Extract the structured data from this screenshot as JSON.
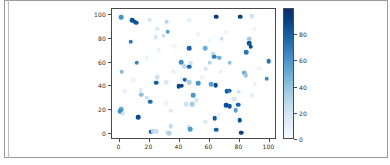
{
  "figure": {
    "background_color": "#ffffff",
    "frame_color": "#9a9a9a"
  },
  "chart_data": {
    "type": "scatter",
    "title": "",
    "xlabel": "",
    "ylabel": "",
    "colormap": "Blues",
    "grid": false,
    "legend": null,
    "xlim": [
      -5,
      105
    ],
    "ylim": [
      -5,
      105
    ],
    "xticks": [
      0,
      20,
      40,
      60,
      80,
      100
    ],
    "yticks": [
      0,
      20,
      40,
      60,
      80,
      100
    ],
    "xticklabels": [
      "0",
      "20",
      "40",
      "60",
      "80",
      "100"
    ],
    "yticklabels": [
      "0",
      "20",
      "40",
      "60",
      "80",
      "100"
    ],
    "colorbar": {
      "ticks": [
        0,
        20,
        40,
        60,
        80
      ],
      "ticklabels": [
        "0",
        "20",
        "40",
        "60",
        "80"
      ],
      "vmin": 0,
      "vmax": 100,
      "low_color": "#f7fbff",
      "high_color": "#08306b",
      "position": "right",
      "orientation": "vertical"
    },
    "marker": "o",
    "n_points": 100,
    "points": [
      {
        "x": 1.0,
        "y": 98.0,
        "c": 62
      },
      {
        "x": 8.5,
        "y": 95.5,
        "c": 88
      },
      {
        "x": 10.0,
        "y": 94.5,
        "c": 90
      },
      {
        "x": 11.0,
        "y": 93.5,
        "c": 85
      },
      {
        "x": 20.0,
        "y": 96.0,
        "c": 18
      },
      {
        "x": 31.5,
        "y": 94.5,
        "c": 30
      },
      {
        "x": 46.5,
        "y": 95.5,
        "c": 8
      },
      {
        "x": 64.5,
        "y": 98.5,
        "c": 96
      },
      {
        "x": 80.5,
        "y": 98.5,
        "c": 94
      },
      {
        "x": 88.0,
        "y": 99.0,
        "c": 20
      },
      {
        "x": 25.0,
        "y": 88.5,
        "c": 14
      },
      {
        "x": 32.0,
        "y": 86.0,
        "c": 58
      },
      {
        "x": 29.5,
        "y": 82.5,
        "c": 22
      },
      {
        "x": 24.0,
        "y": 81.5,
        "c": 16
      },
      {
        "x": 68.0,
        "y": 80.0,
        "c": 20
      },
      {
        "x": 86.5,
        "y": 80.0,
        "c": 36
      },
      {
        "x": 7.5,
        "y": 77.5,
        "c": 72
      },
      {
        "x": 86.5,
        "y": 76.5,
        "c": 85
      },
      {
        "x": 87.5,
        "y": 73.5,
        "c": 90
      },
      {
        "x": 46.5,
        "y": 72.0,
        "c": 80
      },
      {
        "x": 57.0,
        "y": 72.0,
        "c": 50
      },
      {
        "x": 62.5,
        "y": 67.5,
        "c": 26
      },
      {
        "x": 63.0,
        "y": 65.0,
        "c": 70
      },
      {
        "x": 84.5,
        "y": 68.5,
        "c": 72
      },
      {
        "x": 66.5,
        "y": 64.0,
        "c": 48
      },
      {
        "x": 11.5,
        "y": 60.0,
        "c": 68
      },
      {
        "x": 99.5,
        "y": 61.0,
        "c": 74
      },
      {
        "x": 41.0,
        "y": 60.5,
        "c": 64
      },
      {
        "x": 47.5,
        "y": 59.5,
        "c": 20
      },
      {
        "x": 60.0,
        "y": 60.0,
        "c": 30
      },
      {
        "x": 73.5,
        "y": 60.0,
        "c": 40
      },
      {
        "x": 43.0,
        "y": 57.0,
        "c": 26
      },
      {
        "x": 46.5,
        "y": 56.5,
        "c": 78
      },
      {
        "x": 57.5,
        "y": 55.0,
        "c": 18
      },
      {
        "x": 1.5,
        "y": 52.5,
        "c": 44
      },
      {
        "x": 83.0,
        "y": 51.5,
        "c": 50
      },
      {
        "x": 84.0,
        "y": 49.5,
        "c": 40
      },
      {
        "x": 25.0,
        "y": 47.5,
        "c": 20
      },
      {
        "x": 41.5,
        "y": 46.5,
        "c": 10
      },
      {
        "x": 43.5,
        "y": 45.5,
        "c": 80
      },
      {
        "x": 46.5,
        "y": 43.5,
        "c": 34
      },
      {
        "x": 98.0,
        "y": 46.5,
        "c": 66
      },
      {
        "x": 31.0,
        "y": 43.5,
        "c": 14
      },
      {
        "x": 24.5,
        "y": 43.0,
        "c": 82
      },
      {
        "x": 41.5,
        "y": 40.5,
        "c": 96
      },
      {
        "x": 39.5,
        "y": 40.0,
        "c": 92
      },
      {
        "x": 52.5,
        "y": 42.5,
        "c": 62
      },
      {
        "x": 61.0,
        "y": 42.0,
        "c": 56
      },
      {
        "x": 64.0,
        "y": 41.0,
        "c": 90
      },
      {
        "x": 14.0,
        "y": 37.0,
        "c": 12
      },
      {
        "x": 3.5,
        "y": 36.0,
        "c": 8
      },
      {
        "x": 71.5,
        "y": 36.0,
        "c": 82
      },
      {
        "x": 73.0,
        "y": 36.5,
        "c": 76
      },
      {
        "x": 79.5,
        "y": 35.5,
        "c": 20
      },
      {
        "x": 14.5,
        "y": 33.0,
        "c": 42
      },
      {
        "x": 49.0,
        "y": 32.5,
        "c": 60
      },
      {
        "x": 88.0,
        "y": 32.5,
        "c": 10
      },
      {
        "x": 18.0,
        "y": 30.5,
        "c": 22
      },
      {
        "x": 20.5,
        "y": 27.0,
        "c": 76
      },
      {
        "x": 51.0,
        "y": 28.5,
        "c": 14
      },
      {
        "x": 76.5,
        "y": 29.5,
        "c": 16
      },
      {
        "x": 31.0,
        "y": 26.0,
        "c": 6
      },
      {
        "x": 44.5,
        "y": 25.0,
        "c": 20
      },
      {
        "x": 48.5,
        "y": 25.0,
        "c": 36
      },
      {
        "x": 71.0,
        "y": 24.0,
        "c": 88
      },
      {
        "x": 73.5,
        "y": 23.5,
        "c": 86
      },
      {
        "x": 79.0,
        "y": 24.5,
        "c": 80
      },
      {
        "x": 1.0,
        "y": 21.0,
        "c": 52
      },
      {
        "x": 0.5,
        "y": 19.0,
        "c": 64
      },
      {
        "x": 2.0,
        "y": 17.0,
        "c": 24
      },
      {
        "x": 34.0,
        "y": 19.5,
        "c": 16
      },
      {
        "x": 77.5,
        "y": 20.0,
        "c": 56
      },
      {
        "x": 12.5,
        "y": 14.0,
        "c": 90
      },
      {
        "x": 63.5,
        "y": 13.5,
        "c": 84
      },
      {
        "x": 80.0,
        "y": 11.5,
        "c": 88
      },
      {
        "x": 57.0,
        "y": 10.5,
        "c": 12
      },
      {
        "x": 34.0,
        "y": 6.5,
        "c": 26
      },
      {
        "x": 46.0,
        "y": 5.5,
        "c": 18
      },
      {
        "x": 47.0,
        "y": 4.0,
        "c": 58
      },
      {
        "x": 64.5,
        "y": 3.5,
        "c": 80
      },
      {
        "x": 21.0,
        "y": 2.0,
        "c": 86
      },
      {
        "x": 22.0,
        "y": 2.5,
        "c": 28
      },
      {
        "x": 24.5,
        "y": 2.5,
        "c": 22
      },
      {
        "x": 31.5,
        "y": 1.5,
        "c": 10
      },
      {
        "x": 33.0,
        "y": 0.5,
        "c": 32
      },
      {
        "x": 81.0,
        "y": 1.0,
        "c": 94
      },
      {
        "x": 18.0,
        "y": 64.0,
        "c": 6
      },
      {
        "x": 26.0,
        "y": 70.5,
        "c": 8
      },
      {
        "x": 36.5,
        "y": 74.0,
        "c": 4
      },
      {
        "x": 52.0,
        "y": 84.0,
        "c": 6
      },
      {
        "x": 60.0,
        "y": 78.5,
        "c": 6
      },
      {
        "x": 71.0,
        "y": 86.0,
        "c": 4
      },
      {
        "x": 90.0,
        "y": 88.0,
        "c": 4
      },
      {
        "x": 93.0,
        "y": 55.0,
        "c": 6
      },
      {
        "x": 90.0,
        "y": 42.0,
        "c": 6
      },
      {
        "x": 67.5,
        "y": 52.5,
        "c": 8
      },
      {
        "x": 55.0,
        "y": 47.5,
        "c": 6
      },
      {
        "x": 36.0,
        "y": 52.5,
        "c": 10
      },
      {
        "x": 9.0,
        "y": 45.0,
        "c": 6
      },
      {
        "x": 66.0,
        "y": 16.0,
        "c": 6
      }
    ]
  }
}
